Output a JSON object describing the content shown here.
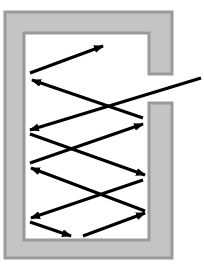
{
  "diagram": {
    "colors": {
      "background": "#ffffff",
      "wall_fill": "#c4c4c4",
      "wall_edge": "#9a9a9a",
      "ray": "#000000"
    },
    "cavity": {
      "outer": {
        "x1": 5,
        "y1": 12,
        "x2": 172,
        "y2": 258
      },
      "inner": {
        "x1": 24,
        "y1": 33,
        "x2": 149,
        "y2": 240
      },
      "opening": {
        "y1": 74,
        "y2": 103
      }
    },
    "rays": [
      {
        "id": "incoming",
        "x1": 201,
        "y1": 78,
        "x2": 30,
        "y2": 130
      },
      {
        "id": "r1",
        "x1": 30,
        "y1": 73,
        "x2": 103,
        "y2": 46
      },
      {
        "id": "r2",
        "x1": 143,
        "y1": 118,
        "x2": 32,
        "y2": 80
      },
      {
        "id": "r3",
        "x1": 30,
        "y1": 163,
        "x2": 143,
        "y2": 124
      },
      {
        "id": "r4",
        "x1": 30,
        "y1": 134,
        "x2": 145,
        "y2": 175
      },
      {
        "id": "r5",
        "x1": 145,
        "y1": 211,
        "x2": 31,
        "y2": 168
      },
      {
        "id": "r6",
        "x1": 143,
        "y1": 180,
        "x2": 31,
        "y2": 218
      },
      {
        "id": "r7",
        "x1": 30,
        "y1": 222,
        "x2": 71,
        "y2": 236
      },
      {
        "id": "r8",
        "x1": 83,
        "y1": 236,
        "x2": 145,
        "y2": 213
      }
    ]
  }
}
